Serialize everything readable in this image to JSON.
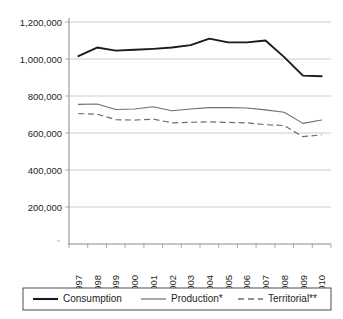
{
  "chart_data": {
    "type": "line",
    "title": "",
    "subtitle": "",
    "xlabel": "",
    "ylabel": "",
    "grid": true,
    "legend_position": "bottom",
    "categories": [
      "1997",
      "1998",
      "1999",
      "2000",
      "2001",
      "2002",
      "2003",
      "2004",
      "2005",
      "2006",
      "2007",
      "2008",
      "2009",
      "2010"
    ],
    "ylim": [
      0,
      1200000
    ],
    "ytick_values": [
      200000,
      400000,
      600000,
      800000,
      1000000,
      1200000
    ],
    "ytick_labels": [
      "200,000",
      "400,000",
      "600,000",
      "800,000",
      "1,000,000",
      "1,200,000"
    ],
    "series": [
      {
        "name": "Consumption",
        "style": "solid-thick",
        "color": "#1a1a1a",
        "values": [
          1015000,
          1062000,
          1045000,
          1050000,
          1055000,
          1062000,
          1075000,
          1110000,
          1090000,
          1090000,
          1100000,
          1010000,
          910000,
          907000
        ]
      },
      {
        "name": "Production*",
        "style": "solid-thin",
        "color": "#6e6e6e",
        "values": [
          755000,
          757000,
          727000,
          730000,
          742000,
          720000,
          730000,
          737000,
          737000,
          735000,
          725000,
          712000,
          652000,
          670000
        ]
      },
      {
        "name": "Territorial**",
        "style": "dashed",
        "color": "#6e6e6e",
        "values": [
          705000,
          702000,
          672000,
          670000,
          675000,
          655000,
          658000,
          660000,
          657000,
          655000,
          645000,
          640000,
          580000,
          590000
        ]
      }
    ]
  },
  "legend": {
    "items": [
      {
        "label": "Consumption",
        "swatch": "solid-thick-line-icon"
      },
      {
        "label": "Production*",
        "swatch": "solid-thin-line-icon"
      },
      {
        "label": "Territorial**",
        "swatch": "dashed-line-icon"
      }
    ]
  }
}
